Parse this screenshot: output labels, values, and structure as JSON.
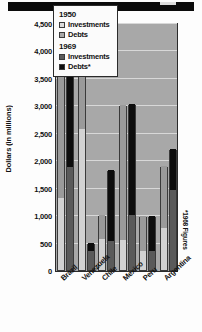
{
  "chart_data": {
    "type": "bar",
    "title": "",
    "xlabel": "",
    "ylabel": "Dollars (in millions)",
    "ylim": [
      0,
      4500
    ],
    "grid": true,
    "legend_position": "top-right-inside",
    "categories": [
      "Brazil",
      "Venezuela",
      "Chile",
      "Mexico",
      "Peru",
      "Argentina"
    ],
    "yticks": [
      "0",
      "500",
      "1,000",
      "1,500",
      "2,000",
      "2,500",
      "3,000",
      "3,500",
      "4,000",
      "4,500"
    ],
    "ytick_values": [
      0,
      500,
      1000,
      1500,
      2000,
      2500,
      3000,
      3500,
      4000,
      4500
    ],
    "series": [
      {
        "name": "1950 Investments",
        "key": "inv50",
        "color": "#d2d2d2",
        "values": [
          1320,
          2570,
          570,
          540,
          340,
          770
        ]
      },
      {
        "name": "1950 Debts",
        "key": "debt50",
        "color": "#9a9a9a",
        "values": [
          3660,
          4500,
          1010,
          3010,
          980,
          1890
        ]
      },
      {
        "name": "1969 Investments",
        "key": "inv69",
        "color": "#5a5a5a",
        "values": [
          1880,
          340,
          520,
          1010,
          340,
          1450
        ]
      },
      {
        "name": "1969 Debts",
        "key": "debt69",
        "color": "#0d0d0d",
        "values": [
          4300,
          490,
          1830,
          3030,
          990,
          2210
        ]
      }
    ],
    "footnote": "*1968 Figures",
    "plot_background": "#a8a8a8"
  },
  "legend": {
    "groups": [
      {
        "year": "1950",
        "rows": [
          {
            "label": "Investments",
            "key": "inv50"
          },
          {
            "label": "Debts",
            "key": "debt50"
          }
        ]
      },
      {
        "year": "1969",
        "rows": [
          {
            "label": "Investments",
            "key": "inv69"
          },
          {
            "label": "Debts*",
            "key": "debt69"
          }
        ]
      }
    ]
  }
}
